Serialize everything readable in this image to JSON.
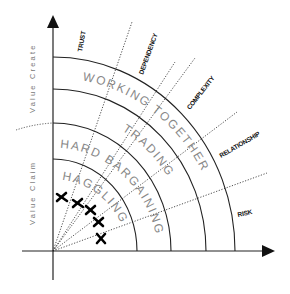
{
  "diagram": {
    "type": "negotiation-spectrum-quadrant",
    "axes": {
      "y_axis_label_upper": "Value Create",
      "y_axis_label_lower": "Value Claim"
    },
    "bands": [
      {
        "label": "HAGGLING"
      },
      {
        "label": "HARD BARGAINING"
      },
      {
        "label": "TRADING"
      },
      {
        "label": "WORKING TOGETHER"
      }
    ],
    "dimensions": [
      {
        "label": "TRUST"
      },
      {
        "label": "DEPENDENCY"
      },
      {
        "label": "COMPLEXITY"
      },
      {
        "label": "RELATIONSHIP"
      },
      {
        "label": "RISK"
      }
    ],
    "markers": {
      "symbol": "X",
      "count": 5
    },
    "colors": {
      "line": "#222222",
      "band_text": "#888888",
      "axis_text": "#777777"
    }
  }
}
